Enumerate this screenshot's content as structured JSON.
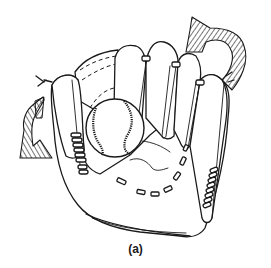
{
  "figure": {
    "caption": "(a)",
    "arrows": [
      {
        "name": "right-rotation-arrow",
        "position": "top-right",
        "style": "hatched curved arrow"
      },
      {
        "name": "left-rotation-arrow",
        "position": "left",
        "style": "hatched curved arrow"
      }
    ],
    "colors": {
      "line": "#1a1a1a",
      "background": "#ffffff"
    }
  }
}
